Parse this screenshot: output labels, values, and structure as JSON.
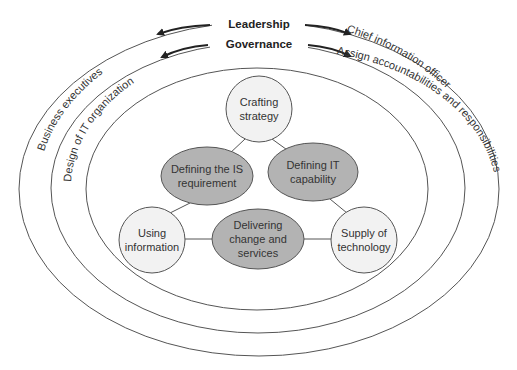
{
  "diagram": {
    "rings": {
      "outer_left": "Business executives",
      "outer_right": "Chief information officer",
      "middle_left": "Design of IT organization",
      "middle_right": "Assign accountabilities and responsibilities",
      "top_outer": "Leadership",
      "top_middle": "Governance"
    },
    "nodes": {
      "crafting_strategy": [
        "Crafting",
        "strategy"
      ],
      "defining_is": [
        "Defining the IS",
        "requirement"
      ],
      "defining_it": [
        "Defining IT",
        "capability"
      ],
      "using_information": [
        "Using",
        "information"
      ],
      "delivering": [
        "Delivering",
        "change and",
        "services"
      ],
      "supply_technology": [
        "Supply of",
        "technology"
      ]
    },
    "colors": {
      "light_node": "#f2f2f2",
      "dark_node": "#b3b3b3",
      "stroke": "#555555"
    }
  }
}
